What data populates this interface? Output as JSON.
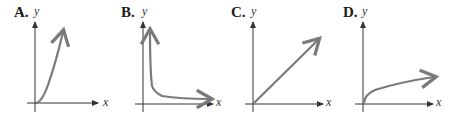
{
  "figure": {
    "panels": [
      {
        "label": "A.",
        "x_axis": "x",
        "y_axis": "y",
        "curve": "increasing, concave up (e.g. y = x^2)"
      },
      {
        "label": "B.",
        "x_axis": "x",
        "y_axis": "y",
        "curve": "decreasing, approaching x-axis (e.g. y = 1/x)"
      },
      {
        "label": "C.",
        "x_axis": "x",
        "y_axis": "y",
        "curve": "linear increasing (e.g. y = x)"
      },
      {
        "label": "D.",
        "x_axis": "x",
        "y_axis": "y",
        "curve": "increasing, concave down (e.g. y = sqrt(x))"
      }
    ],
    "colors": {
      "curve": "#7a7a7a",
      "axis": "#333333",
      "text": "#1a1a1a"
    }
  }
}
